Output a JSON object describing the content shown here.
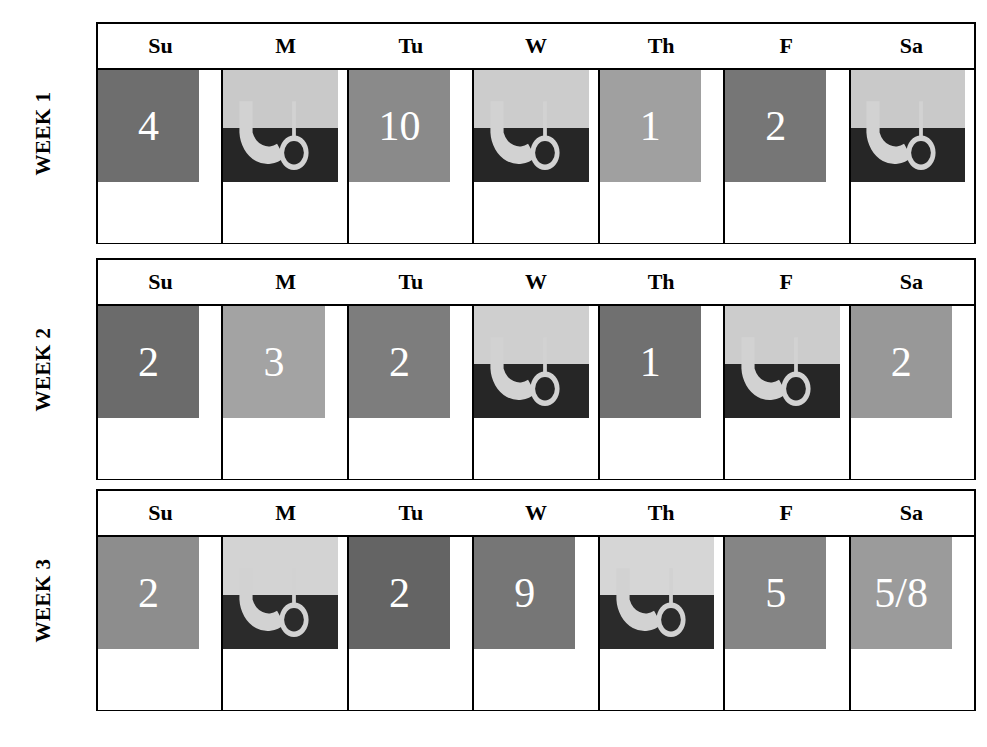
{
  "figure": {
    "type": "calendar-grid",
    "weeks": [
      {
        "label": "WEEK 1",
        "day_headers": [
          "Su",
          "M",
          "Tu",
          "W",
          "Th",
          "F",
          "Sa"
        ],
        "cells": [
          {
            "day": "Su",
            "kind": "number",
            "value": "4",
            "fill": "#6e6e6e"
          },
          {
            "day": "M",
            "kind": "icon",
            "value": "",
            "icon": "moon-phase-icon",
            "fill_top": "#c9c9c9",
            "fill_bottom": "#262626",
            "icon_color": "#d2d2d2"
          },
          {
            "day": "Tu",
            "kind": "number",
            "value": "10",
            "fill": "#8a8a8a"
          },
          {
            "day": "W",
            "kind": "icon",
            "value": "",
            "icon": "moon-phase-icon",
            "fill_top": "#cccccc",
            "fill_bottom": "#262626",
            "icon_color": "#d2d2d2"
          },
          {
            "day": "Th",
            "kind": "number",
            "value": "1",
            "fill": "#a0a0a0"
          },
          {
            "day": "F",
            "kind": "number",
            "value": "2",
            "fill": "#767676"
          },
          {
            "day": "Sa",
            "kind": "icon",
            "value": "",
            "icon": "moon-phase-icon",
            "fill_top": "#c9c9c9",
            "fill_bottom": "#262626",
            "icon_color": "#d2d2d2"
          }
        ]
      },
      {
        "label": "WEEK 2",
        "day_headers": [
          "Su",
          "M",
          "Tu",
          "W",
          "Th",
          "F",
          "Sa"
        ],
        "cells": [
          {
            "day": "Su",
            "kind": "number",
            "value": "2",
            "fill": "#6b6b6b"
          },
          {
            "day": "M",
            "kind": "number",
            "value": "3",
            "fill": "#a3a3a3"
          },
          {
            "day": "Tu",
            "kind": "number",
            "value": "2",
            "fill": "#7d7d7d"
          },
          {
            "day": "W",
            "kind": "icon",
            "value": "",
            "icon": "moon-phase-icon",
            "fill_top": "#cfcfcf",
            "fill_bottom": "#262626",
            "icon_color": "#d2d2d2"
          },
          {
            "day": "Th",
            "kind": "number",
            "value": "1",
            "fill": "#707070"
          },
          {
            "day": "F",
            "kind": "icon",
            "value": "",
            "icon": "moon-phase-icon",
            "fill_top": "#cccccc",
            "fill_bottom": "#262626",
            "icon_color": "#d2d2d2"
          },
          {
            "day": "Sa",
            "kind": "number",
            "value": "2",
            "fill": "#989898"
          }
        ]
      },
      {
        "label": "WEEK 3",
        "day_headers": [
          "Su",
          "M",
          "Tu",
          "W",
          "Th",
          "F",
          "Sa"
        ],
        "cells": [
          {
            "day": "Su",
            "kind": "number",
            "value": "2",
            "fill": "#8d8d8d"
          },
          {
            "day": "M",
            "kind": "icon",
            "value": "",
            "icon": "moon-phase-icon",
            "fill_top": "#d3d3d3",
            "fill_bottom": "#2b2b2b",
            "icon_color": "#d2d2d2"
          },
          {
            "day": "Tu",
            "kind": "number",
            "value": "2",
            "fill": "#646464"
          },
          {
            "day": "W",
            "kind": "number",
            "value": "9",
            "fill": "#767676"
          },
          {
            "day": "Th",
            "kind": "icon",
            "value": "",
            "icon": "moon-phase-icon",
            "fill_top": "#d6d6d6",
            "fill_bottom": "#2b2b2b",
            "icon_color": "#d2d2d2"
          },
          {
            "day": "F",
            "kind": "number",
            "value": "5",
            "fill": "#858585"
          },
          {
            "day": "Sa",
            "kind": "number",
            "value": "5/8",
            "fill": "#9b9b9b"
          }
        ]
      }
    ]
  }
}
